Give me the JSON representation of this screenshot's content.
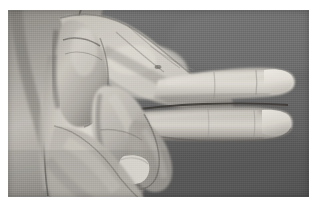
{
  "page": {
    "width": 317,
    "height": 212,
    "background_color": "#ffffff",
    "kind": "photograph"
  },
  "photo": {
    "alt_text": "Grayscale photograph of a right hand viewed from the ulnar side, index and middle fingers extended horizontally to the right while the ring and little fingers are flexed into the palm and the thumb is folded across",
    "caption": "",
    "frame": {
      "x": 8,
      "y": 10,
      "width": 301,
      "height": 187
    },
    "colorspace": "grayscale",
    "background_color": "#6b6b6b",
    "background_color_lower": "#5f5f5f",
    "skin_midtone": "#b8b4ae",
    "skin_highlight": "#e8e4dd",
    "skin_shadow": "#6e6a66",
    "nail_highlight": "#f2efe8",
    "crease_line_color": "#3a3734",
    "subject": "human hand",
    "orientation": "fingers pointing right",
    "grain": "visible horizontal scanline texture"
  },
  "anatomy": {
    "label_forearm": "forearm",
    "label_wrist": "wrist",
    "label_palm": "palm",
    "label_thumb": "thumb",
    "label_index_finger": "index finger",
    "label_middle_finger": "middle finger",
    "label_flexed_fingers": "flexed ring and little fingers",
    "label_fingernail": "fingernail",
    "label_knuckles": "knuckles"
  }
}
